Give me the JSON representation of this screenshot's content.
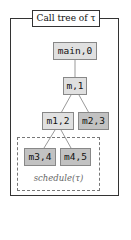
{
  "title": "Call tree of τ",
  "nodes": [
    {
      "id": "main0",
      "label": "main,0",
      "shade": "light"
    },
    {
      "id": "m1",
      "label": "m,1",
      "shade": "light"
    },
    {
      "id": "m12",
      "label": "m1,2",
      "shade": "light"
    },
    {
      "id": "m23",
      "label": "m2,3",
      "shade": "dark"
    },
    {
      "id": "m34",
      "label": "m3,4",
      "shade": "dark"
    },
    {
      "id": "m45",
      "label": "m4,5",
      "shade": "dark"
    }
  ],
  "edges": [
    [
      "main,0",
      "m,1"
    ],
    [
      "m,1",
      "m1,2"
    ],
    [
      "m,1",
      "m2,3"
    ],
    [
      "m1,2",
      "m3,4"
    ],
    [
      "m1,2",
      "m4,5"
    ]
  ],
  "group_label": "schedule(τ)",
  "colors": {
    "light": "#e0e0e0",
    "dark": "#c2c2c2",
    "border": "#333333",
    "dashed": "#777777"
  }
}
